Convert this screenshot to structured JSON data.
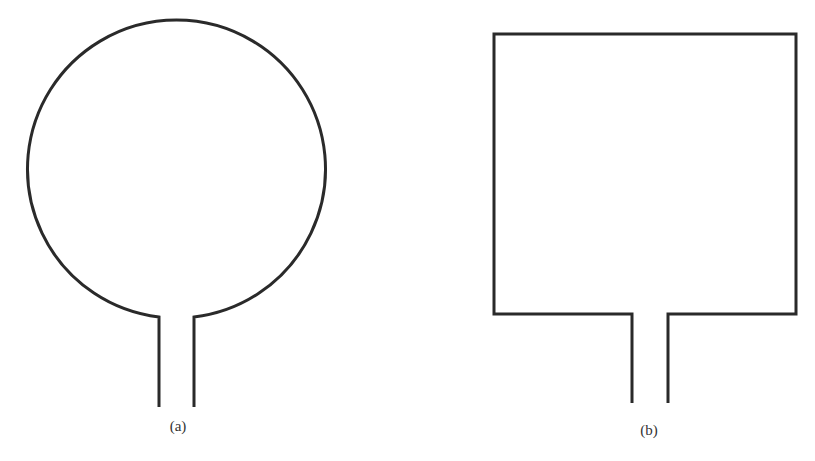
{
  "figure": {
    "stroke_color": "#2a2a2a",
    "stroke_width": 3,
    "panels": [
      {
        "id": "a",
        "label": "(a)",
        "shape": "circle",
        "description": "Circular loop with feed lines",
        "circle": {
          "cx": 176,
          "cy": 171,
          "r": 149
        },
        "feed": {
          "left_x": 159,
          "right_x": 194,
          "top_y": 317,
          "bottom_y": 407
        },
        "label_pos": {
          "x": 178,
          "y": 418
        }
      },
      {
        "id": "b",
        "label": "(b)",
        "shape": "square",
        "description": "Square loop with feed lines",
        "rect": {
          "x1": 494,
          "y1": 34,
          "x2": 796,
          "y2": 314
        },
        "feed": {
          "left_x": 632,
          "right_x": 668,
          "bottom_y": 403
        },
        "label_pos": {
          "x": 649,
          "y": 422
        }
      }
    ]
  },
  "cropped_header_text": "...ctangle, ...  ... ..., ... ..."
}
